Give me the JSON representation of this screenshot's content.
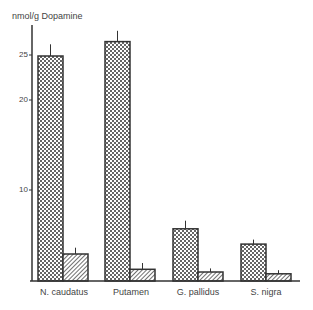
{
  "chart_data": {
    "type": "bar",
    "title": "",
    "ylabel": "nmol/g Dopamine",
    "xlabel": "",
    "categories": [
      "N. caudatus",
      "Putamen",
      "G. pallidus",
      "S. nigra"
    ],
    "series": [
      {
        "name": "Series 1 (dotted)",
        "pattern": "dots",
        "values": [
          25.0,
          26.6,
          5.8,
          4.1
        ],
        "error": [
          1.3,
          1.2,
          0.9,
          0.5
        ]
      },
      {
        "name": "Series 2 (hatched)",
        "pattern": "hatch",
        "values": [
          3.0,
          1.3,
          1.0,
          0.8
        ],
        "error": [
          0.7,
          0.7,
          0.4,
          0.4
        ]
      }
    ],
    "yticks": [
      10,
      20,
      25
    ],
    "ylim": [
      0,
      28
    ],
    "grid": false,
    "legend": "none"
  },
  "axis": {
    "ylabel": "nmol/g Dopamine",
    "tick_10": "10",
    "tick_20": "20",
    "tick_25": "25"
  },
  "categories": {
    "c0": "N. caudatus",
    "c1": "Putamen",
    "c2": "G. pallidus",
    "c3": "S. nigra"
  }
}
